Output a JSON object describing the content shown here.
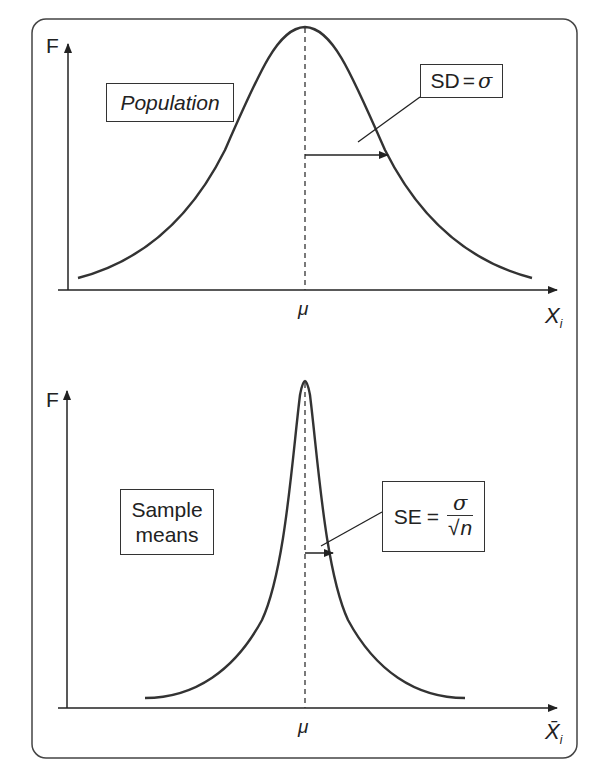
{
  "panels": [
    {
      "id": "population",
      "y_axis_label": "F",
      "x_axis_label": "X",
      "x_axis_subscript": "i",
      "center_label": "μ",
      "box_label": "Population",
      "annotation": {
        "lhs": "SD",
        "eq": "=",
        "rhs": "σ"
      }
    },
    {
      "id": "sample-means",
      "y_axis_label": "F",
      "x_axis_label": "X̄",
      "x_axis_subscript": "i",
      "center_label": "μ",
      "box_label_line1": "Sample",
      "box_label_line2": "means",
      "annotation": {
        "lhs": "SE",
        "eq": "=",
        "numerator": "σ",
        "sqrt": "√",
        "denominator": "n"
      }
    }
  ],
  "colors": {
    "line": "#333333",
    "background": "#ffffff"
  }
}
